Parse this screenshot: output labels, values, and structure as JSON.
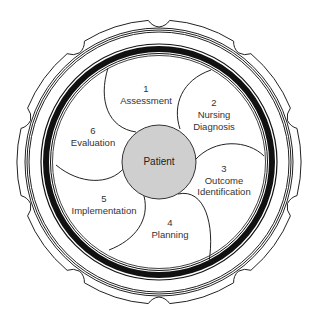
{
  "diagram": {
    "center": {
      "label": "Patient",
      "fill": "#cfcfcf"
    },
    "steps": [
      {
        "number": "1",
        "label": "Assessment"
      },
      {
        "number": "2",
        "label": "Nursing Diagnosis",
        "line1": "Nursing",
        "line2": "Diagnosis"
      },
      {
        "number": "3",
        "label": "Outcome Identification",
        "line1": "Outcome",
        "line2": "Identification"
      },
      {
        "number": "4",
        "label": "Planning"
      },
      {
        "number": "5",
        "label": "Implementation"
      },
      {
        "number": "6",
        "label": "Evaluation"
      }
    ],
    "colors": {
      "ring": "#111111",
      "background": "#ffffff",
      "text": "#333333"
    }
  }
}
